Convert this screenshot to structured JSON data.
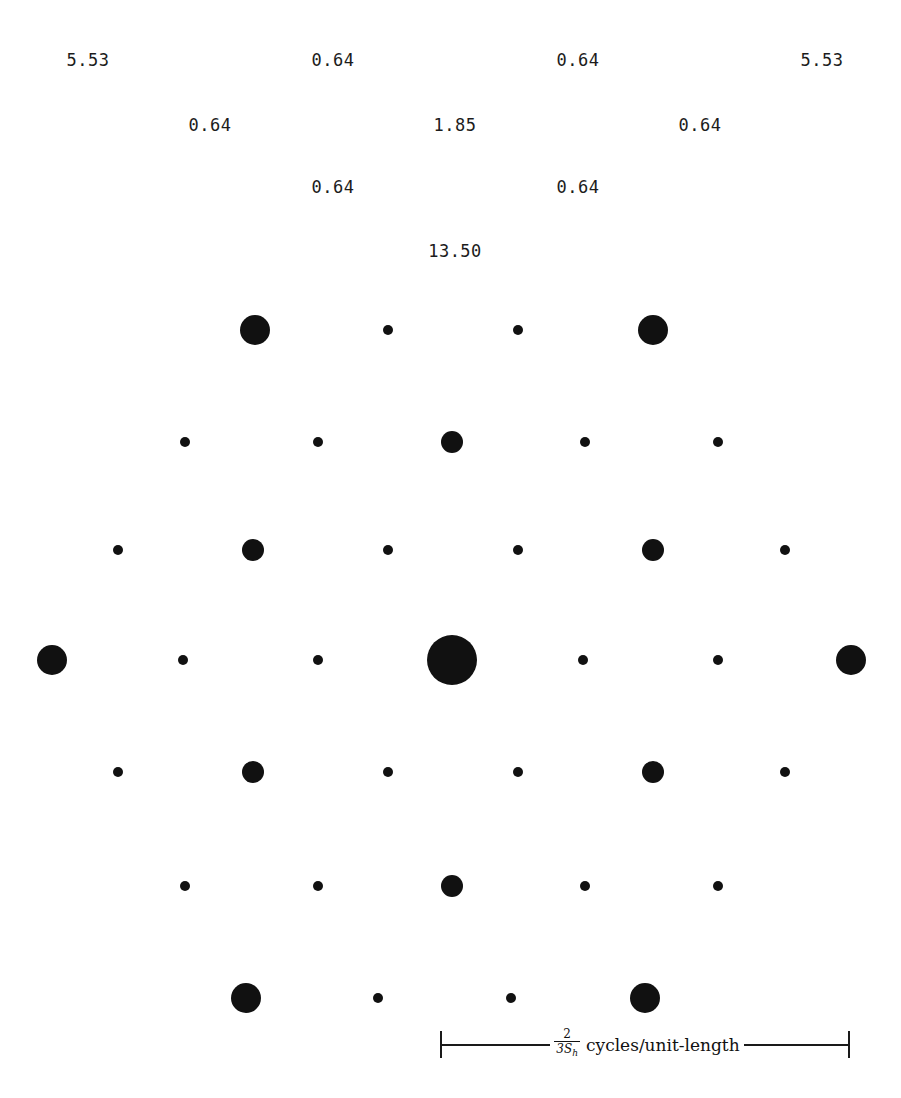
{
  "figure": {
    "width": 901,
    "height": 1098,
    "background": "#ffffff",
    "dot_color": "#111111",
    "label_color": "#1c1c1c"
  },
  "annotations": {
    "description": "Peak magnitude values annotated above the lattice",
    "labels": [
      {
        "text": "5.53",
        "x": 88,
        "y": 60
      },
      {
        "text": "0.64",
        "x": 333,
        "y": 60
      },
      {
        "text": "0.64",
        "x": 578,
        "y": 60
      },
      {
        "text": "5.53",
        "x": 822,
        "y": 60
      },
      {
        "text": "0.64",
        "x": 210,
        "y": 125
      },
      {
        "text": "1.85",
        "x": 455,
        "y": 125
      },
      {
        "text": "0.64",
        "x": 700,
        "y": 125
      },
      {
        "text": "0.64",
        "x": 333,
        "y": 187
      },
      {
        "text": "0.64",
        "x": 578,
        "y": 187
      },
      {
        "text": "13.50",
        "x": 455,
        "y": 251
      }
    ]
  },
  "scalebar": {
    "numerator": "2",
    "denominator_base": "3S",
    "denominator_sub": "h",
    "units": "cycles/unit-length",
    "left_px": 440,
    "right_px": 850
  },
  "chart_data": {
    "type": "scatter",
    "title": "",
    "subtitle": "",
    "xlabel": "",
    "ylabel": "",
    "xlim": [
      0,
      901
    ],
    "ylim": [
      0,
      1098
    ],
    "grid": false,
    "legend": null,
    "magnitude_classes": [
      {
        "name": "dc",
        "radius_px": 25,
        "value": 13.5
      },
      {
        "name": "large",
        "radius_px": 15,
        "value": 5.53
      },
      {
        "name": "medium",
        "radius_px": 11,
        "value": 1.85
      },
      {
        "name": "small",
        "radius_px": 5,
        "value": 0.64
      }
    ],
    "points": [
      {
        "x": 255,
        "y": 330,
        "r": 15,
        "class": "large"
      },
      {
        "x": 388,
        "y": 330,
        "r": 5,
        "class": "small"
      },
      {
        "x": 518,
        "y": 330,
        "r": 5,
        "class": "small"
      },
      {
        "x": 653,
        "y": 330,
        "r": 15,
        "class": "large"
      },
      {
        "x": 185,
        "y": 442,
        "r": 5,
        "class": "small"
      },
      {
        "x": 318,
        "y": 442,
        "r": 5,
        "class": "small"
      },
      {
        "x": 452,
        "y": 442,
        "r": 11,
        "class": "medium"
      },
      {
        "x": 585,
        "y": 442,
        "r": 5,
        "class": "small"
      },
      {
        "x": 718,
        "y": 442,
        "r": 5,
        "class": "small"
      },
      {
        "x": 118,
        "y": 550,
        "r": 5,
        "class": "small"
      },
      {
        "x": 253,
        "y": 550,
        "r": 11,
        "class": "medium"
      },
      {
        "x": 388,
        "y": 550,
        "r": 5,
        "class": "small"
      },
      {
        "x": 518,
        "y": 550,
        "r": 5,
        "class": "small"
      },
      {
        "x": 653,
        "y": 550,
        "r": 11,
        "class": "medium"
      },
      {
        "x": 785,
        "y": 550,
        "r": 5,
        "class": "small"
      },
      {
        "x": 52,
        "y": 660,
        "r": 15,
        "class": "large"
      },
      {
        "x": 183,
        "y": 660,
        "r": 5,
        "class": "small"
      },
      {
        "x": 318,
        "y": 660,
        "r": 5,
        "class": "small"
      },
      {
        "x": 452,
        "y": 660,
        "r": 25,
        "class": "dc"
      },
      {
        "x": 583,
        "y": 660,
        "r": 5,
        "class": "small"
      },
      {
        "x": 718,
        "y": 660,
        "r": 5,
        "class": "small"
      },
      {
        "x": 851,
        "y": 660,
        "r": 15,
        "class": "large"
      },
      {
        "x": 118,
        "y": 772,
        "r": 5,
        "class": "small"
      },
      {
        "x": 253,
        "y": 772,
        "r": 11,
        "class": "medium"
      },
      {
        "x": 388,
        "y": 772,
        "r": 5,
        "class": "small"
      },
      {
        "x": 518,
        "y": 772,
        "r": 5,
        "class": "small"
      },
      {
        "x": 653,
        "y": 772,
        "r": 11,
        "class": "medium"
      },
      {
        "x": 785,
        "y": 772,
        "r": 5,
        "class": "small"
      },
      {
        "x": 185,
        "y": 886,
        "r": 5,
        "class": "small"
      },
      {
        "x": 318,
        "y": 886,
        "r": 5,
        "class": "small"
      },
      {
        "x": 452,
        "y": 886,
        "r": 11,
        "class": "medium"
      },
      {
        "x": 585,
        "y": 886,
        "r": 5,
        "class": "small"
      },
      {
        "x": 718,
        "y": 886,
        "r": 5,
        "class": "small"
      },
      {
        "x": 246,
        "y": 998,
        "r": 15,
        "class": "large"
      },
      {
        "x": 378,
        "y": 998,
        "r": 5,
        "class": "small"
      },
      {
        "x": 511,
        "y": 998,
        "r": 5,
        "class": "small"
      },
      {
        "x": 645,
        "y": 998,
        "r": 15,
        "class": "large"
      }
    ]
  }
}
